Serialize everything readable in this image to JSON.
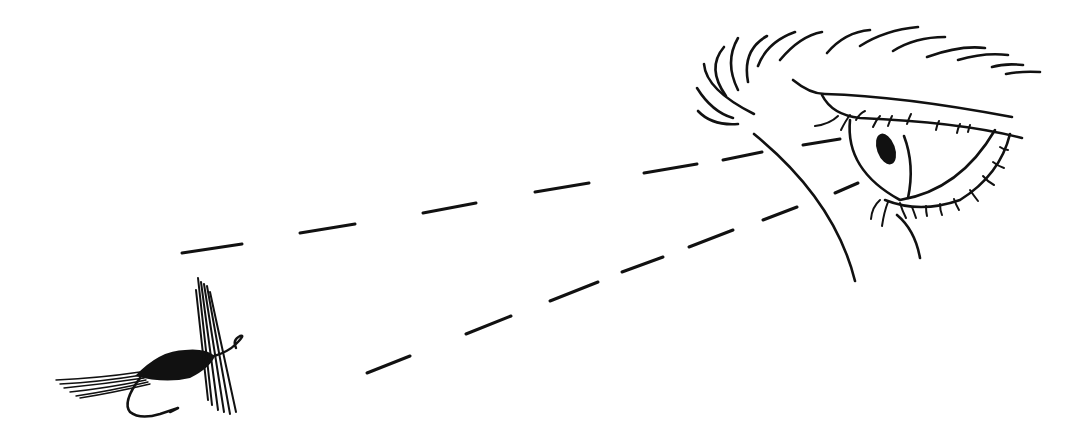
{
  "illustration": {
    "subject": "Eye looking at a fishing fly",
    "elements": [
      "eye-with-eyebrow",
      "dashed-sight-lines",
      "fishing-fly"
    ],
    "colors": {
      "ink": "#111111",
      "background": "#ffffff"
    }
  }
}
